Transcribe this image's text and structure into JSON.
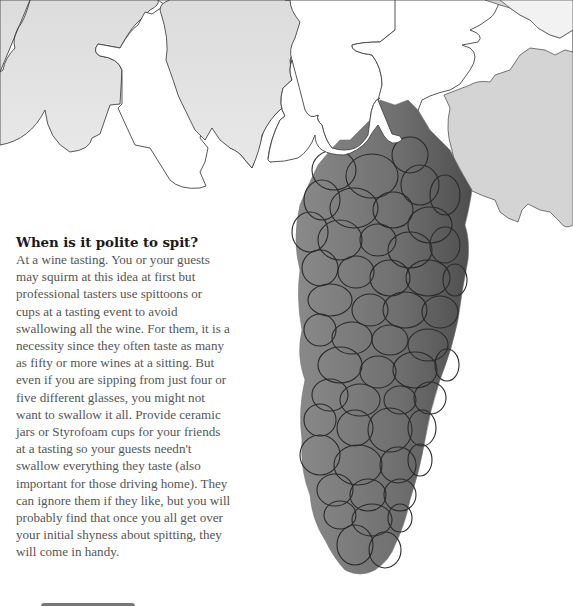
{
  "article": {
    "heading": "When is it polite to spit?",
    "lines": [
      "At a wine tasting. You or your guests",
      "may squirm at this idea at first but",
      "professional tasters use spittoons or",
      "cups at a tasting event to avoid",
      "swallowing all the wine. For them, it is a",
      "necessity since they often taste as many",
      "as fifty or more wines at a sitting. But",
      "even if you are sipping from just four or",
      "five different glasses, you might not",
      "want to swallow it all. Provide ceramic",
      "jars or Styrofoam cups for your friends",
      "at a tasting so your guests needn't",
      "swallow everything they taste (also",
      "important for those driving home). They",
      "can ignore them if they like, but you will",
      "probably find that once you all get over",
      "your initial shyness about spitting, they",
      "will come in handy."
    ]
  },
  "illustration": {
    "subject": "grape-vine-leaves-and-grape-cluster",
    "colors": {
      "leaf_light": "#e4e4e4",
      "leaf_white": "#ffffff",
      "leaf_right": "#d2d2d2",
      "grape_fill": "#7a7a7a",
      "grape_dark": "#555555",
      "outline": "#333333"
    }
  }
}
